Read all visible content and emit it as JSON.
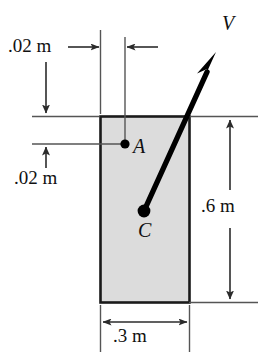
{
  "figure": {
    "type": "engineering-dimension-diagram",
    "background_color": "#ffffff",
    "plate": {
      "fill_color": "#dcdcdc",
      "stroke_color": "#1a1a1a",
      "x": 100,
      "y": 116,
      "width": 90,
      "height": 187
    },
    "points": [
      {
        "name": "A",
        "label": "A",
        "x": 125,
        "y": 144,
        "label_x": 133,
        "label_y": 144
      },
      {
        "name": "C",
        "label": "C",
        "x": 144,
        "y": 211,
        "label_x": 138,
        "label_y": 228
      }
    ],
    "vector": {
      "label": "V",
      "label_x": 222,
      "label_y": 22,
      "from_x": 144,
      "from_y": 211,
      "to_x": 216,
      "to_y": 52,
      "color": "#000000"
    },
    "dimensions": [
      {
        "name": "offset-horizontal",
        "label": ".02 m",
        "value": 0.02,
        "unit": "m",
        "orientation": "horizontal",
        "label_x": 8,
        "label_y": 46
      },
      {
        "name": "offset-vertical",
        "label": ".02 m",
        "value": 0.02,
        "unit": "m",
        "orientation": "vertical",
        "label_x": 14,
        "label_y": 178
      },
      {
        "name": "plate-height",
        "label": ".6 m",
        "value": 0.6,
        "unit": "m",
        "orientation": "vertical",
        "label_x": 201,
        "label_y": 196
      },
      {
        "name": "plate-width",
        "label": ".3 m",
        "value": 0.3,
        "unit": "m",
        "orientation": "horizontal",
        "label_x": 113,
        "label_y": 334
      }
    ]
  }
}
